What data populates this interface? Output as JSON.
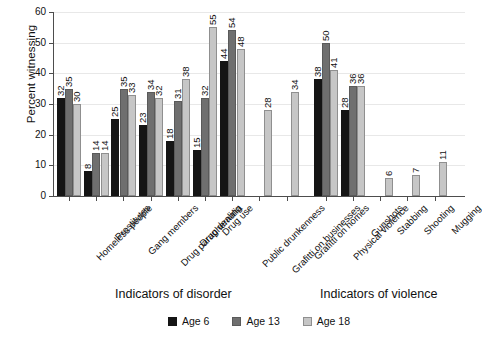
{
  "chart_data": {
    "type": "bar",
    "title": "",
    "xlabel": "",
    "ylabel": "Percent witnessing",
    "ylim": [
      0,
      60
    ],
    "ytick_step": 10,
    "yticks": [
      0,
      10,
      20,
      30,
      40,
      50,
      60
    ],
    "grid": true,
    "legend_position": "bottom-center",
    "categories": [
      "Homeless people",
      "Prostitutes",
      "Gang members",
      "Drug paraphernalia",
      "Drug dealing",
      "Drug use",
      "Public drunkenness",
      "Grafitti on businesses",
      "Grafitti on homes",
      "Physical violence",
      "Gunshots",
      "Stabbing",
      "Shooting",
      "Mugging"
    ],
    "series": [
      {
        "name": "Age 6",
        "color": "#151515",
        "values": [
          32,
          8,
          25,
          23,
          18,
          15,
          44,
          null,
          null,
          38,
          28,
          null,
          null,
          null
        ]
      },
      {
        "name": "Age 13",
        "color": "#6f6f6f",
        "values": [
          35,
          14,
          35,
          34,
          31,
          32,
          54,
          null,
          null,
          50,
          36,
          null,
          null,
          null
        ]
      },
      {
        "name": "Age 18",
        "color": "#c6c6c6",
        "values": [
          30,
          14,
          33,
          32,
          38,
          55,
          48,
          28,
          34,
          41,
          36,
          6,
          7,
          11
        ]
      }
    ],
    "group_captions": [
      {
        "label": "Indicators of disorder",
        "categories_span": [
          0,
          8
        ]
      },
      {
        "label": "Indicators of violence",
        "categories_span": [
          9,
          13
        ]
      }
    ]
  },
  "axis": {
    "y_title": "Percent witnessing"
  },
  "captions": {
    "disorder": "Indicators of disorder",
    "violence": "Indicators of violence"
  },
  "legend": {
    "items": [
      {
        "label": "Age 6"
      },
      {
        "label": "Age 13"
      },
      {
        "label": "Age 18"
      }
    ]
  }
}
